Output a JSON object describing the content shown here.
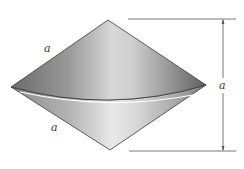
{
  "figure": {
    "labels": {
      "upper_slant": "a",
      "lower_slant": "a",
      "height": "a"
    },
    "colors": {
      "cone_dark": "#5a5a5a",
      "cone_mid": "#a8a8a8",
      "cone_light": "#e6e6e6",
      "base_edge": "#ffffff",
      "outline": "#3a3a3a",
      "dimension_line": "#555555"
    }
  }
}
